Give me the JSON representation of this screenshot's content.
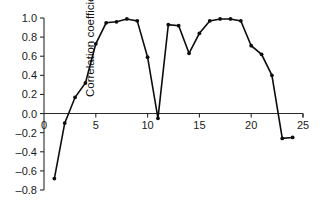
{
  "chart_data": {
    "type": "line",
    "title": "",
    "subtitle": "",
    "xlabel": "",
    "ylabel": "Correlation coefficient",
    "xlim": [
      0,
      25
    ],
    "ylim": [
      -0.8,
      1.0
    ],
    "xticks": [
      0,
      5,
      10,
      15,
      20,
      25
    ],
    "xtick_labels": [
      "0",
      "5",
      "10",
      "15",
      "20",
      "25"
    ],
    "yticks": [
      -0.8,
      -0.6,
      -0.4,
      -0.2,
      0.0,
      0.2,
      0.4,
      0.6,
      0.8,
      1.0
    ],
    "ytick_labels": [
      "–0.8",
      "–0.6",
      "–0.4",
      "–0.2",
      "0.0",
      "0.2",
      "0.4",
      "0.6",
      "0.8",
      "1.0"
    ],
    "grid": false,
    "legend": null,
    "legend_position": "none",
    "marker": "filled-circle",
    "line_color": "#0d0d0d",
    "axis_color": "#2b2b2b",
    "background_color": "#ffffff",
    "x": [
      1,
      2,
      3,
      4,
      5,
      6,
      7,
      8,
      9,
      10,
      11,
      12,
      13,
      14,
      15,
      16,
      17,
      18,
      19,
      20,
      21,
      22,
      23,
      24
    ],
    "values": [
      -0.68,
      -0.1,
      0.17,
      0.32,
      0.73,
      0.95,
      0.96,
      0.99,
      0.97,
      0.59,
      -0.05,
      0.93,
      0.92,
      0.63,
      0.84,
      0.97,
      0.99,
      0.99,
      0.97,
      0.71,
      0.62,
      0.4,
      -0.26,
      -0.25
    ],
    "series": [
      {
        "name": "Correlation coefficient",
        "values": [
          -0.68,
          -0.1,
          0.17,
          0.32,
          0.73,
          0.95,
          0.96,
          0.99,
          0.97,
          0.59,
          -0.05,
          0.93,
          0.92,
          0.63,
          0.84,
          0.97,
          0.99,
          0.99,
          0.97,
          0.71,
          0.62,
          0.4,
          -0.26,
          -0.25
        ]
      }
    ],
    "annotations": []
  }
}
